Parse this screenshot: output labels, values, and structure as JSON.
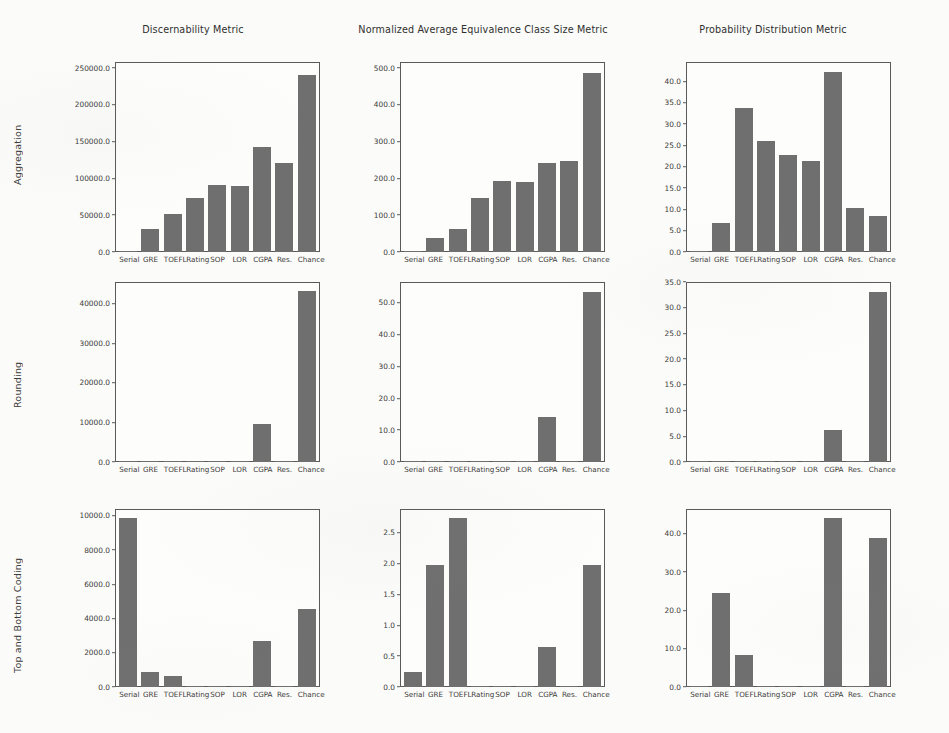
{
  "figure": {
    "row_labels": [
      "Aggregation",
      "Rounding",
      "Top and Bottom Coding"
    ],
    "column_titles": [
      "Discernability Metric",
      "Normalized Average Equivalence Class Size Metric",
      "Probability Distribution Metric"
    ],
    "categories": [
      "Serial",
      "GRE",
      "TOEFL",
      "Rating",
      "SOP",
      "LOR",
      "CGPA",
      "Res.",
      "Chance"
    ],
    "bar_color": "#6f6f6f",
    "background_color": "#fbfbf9",
    "axis_color": "#5a5a5a"
  },
  "chart_data": [
    {
      "type": "bar",
      "title": "Discernability Metric",
      "row": "Aggregation",
      "xlabel": "",
      "ylabel": "",
      "categories": [
        "Serial",
        "GRE",
        "TOEFL",
        "Rating",
        "SOP",
        "LOR",
        "CGPA",
        "Res.",
        "Chance"
      ],
      "values": [
        500.0,
        31000.0,
        52000.0,
        74000.0,
        91000.0,
        89000.0,
        143000.0,
        121000.0,
        241000.0
      ],
      "ylim": [
        0,
        258000
      ],
      "yticks": [
        0.0,
        50000.0,
        100000.0,
        150000.0,
        200000.0,
        250000.0
      ],
      "ytick_labels": [
        "0.0",
        "50000.0",
        "100000.0",
        "150000.0",
        "200000.0",
        "250000.0"
      ],
      "grid": false,
      "legend": "none"
    },
    {
      "type": "bar",
      "title": "Normalized Average Equivalence Class Size Metric",
      "row": "Aggregation",
      "xlabel": "",
      "ylabel": "",
      "categories": [
        "Serial",
        "GRE",
        "TOEFL",
        "Rating",
        "SOP",
        "LOR",
        "CGPA",
        "Res.",
        "Chance"
      ],
      "values": [
        1.0,
        38.0,
        63.0,
        147.0,
        192.0,
        191.0,
        243.0,
        246.0,
        487.0
      ],
      "ylim": [
        0,
        516
      ],
      "yticks": [
        0.0,
        100.0,
        200.0,
        300.0,
        400.0,
        500.0
      ],
      "ytick_labels": [
        "0.0",
        "100.0",
        "200.0",
        "300.0",
        "400.0",
        "500.0"
      ],
      "grid": false,
      "legend": "none"
    },
    {
      "type": "bar",
      "title": "Probability Distribution Metric",
      "row": "Aggregation",
      "xlabel": "",
      "ylabel": "",
      "categories": [
        "Serial",
        "GRE",
        "TOEFL",
        "Rating",
        "SOP",
        "LOR",
        "CGPA",
        "Res.",
        "Chance"
      ],
      "values": [
        0.0,
        6.8,
        33.7,
        26.1,
        22.7,
        21.2,
        42.2,
        10.3,
        8.4
      ],
      "ylim": [
        0,
        44.5
      ],
      "yticks": [
        0.0,
        5.0,
        10.0,
        15.0,
        20.0,
        25.0,
        30.0,
        35.0,
        40.0
      ],
      "ytick_labels": [
        "0.0",
        "5.0",
        "10.0",
        "15.0",
        "20.0",
        "25.0",
        "30.0",
        "35.0",
        "40.0"
      ],
      "grid": false,
      "legend": "none"
    },
    {
      "type": "bar",
      "title": "Discernability Metric",
      "row": "Rounding",
      "xlabel": "",
      "ylabel": "",
      "categories": [
        "Serial",
        "GRE",
        "TOEFL",
        "Rating",
        "SOP",
        "LOR",
        "CGPA",
        "Res.",
        "Chance"
      ],
      "values": [
        0.0,
        0.0,
        0.0,
        0.0,
        0.0,
        0.0,
        9600.0,
        0.0,
        43300.0
      ],
      "ylim": [
        0,
        45500
      ],
      "yticks": [
        0.0,
        10000.0,
        20000.0,
        30000.0,
        40000.0
      ],
      "ytick_labels": [
        "0.0",
        "10000.0",
        "20000.0",
        "30000.0",
        "40000.0"
      ],
      "grid": false,
      "legend": "none"
    },
    {
      "type": "bar",
      "title": "Normalized Average Equivalence Class Size Metric",
      "row": "Rounding",
      "xlabel": "",
      "ylabel": "",
      "categories": [
        "Serial",
        "GRE",
        "TOEFL",
        "Rating",
        "SOP",
        "LOR",
        "CGPA",
        "Res.",
        "Chance"
      ],
      "values": [
        0.0,
        0.0,
        0.0,
        0.0,
        0.0,
        0.0,
        14.0,
        0.0,
        53.5
      ],
      "ylim": [
        0,
        56.5
      ],
      "yticks": [
        0.0,
        10.0,
        20.0,
        30.0,
        40.0,
        50.0
      ],
      "ytick_labels": [
        "0.0",
        "10.0",
        "20.0",
        "30.0",
        "40.0",
        "50.0"
      ],
      "grid": false,
      "legend": "none"
    },
    {
      "type": "bar",
      "title": "Probability Distribution Metric",
      "row": "Rounding",
      "xlabel": "",
      "ylabel": "",
      "categories": [
        "Serial",
        "GRE",
        "TOEFL",
        "Rating",
        "SOP",
        "LOR",
        "CGPA",
        "Res.",
        "Chance"
      ],
      "values": [
        0.0,
        0.0,
        0.0,
        0.0,
        0.0,
        0.0,
        6.3,
        0.0,
        33.0
      ],
      "ylim": [
        0,
        35.0
      ],
      "yticks": [
        0.0,
        5.0,
        10.0,
        15.0,
        20.0,
        25.0,
        30.0,
        35.0
      ],
      "ytick_labels": [
        "0.0",
        "5.0",
        "10.0",
        "15.0",
        "20.0",
        "25.0",
        "30.0",
        "35.0"
      ],
      "grid": false,
      "legend": "none"
    },
    {
      "type": "bar",
      "title": "Discernability Metric",
      "row": "Top and Bottom Coding",
      "xlabel": "",
      "ylabel": "",
      "categories": [
        "Serial",
        "GRE",
        "TOEFL",
        "Rating",
        "SOP",
        "LOR",
        "CGPA",
        "Res.",
        "Chance"
      ],
      "values": [
        9850.0,
        900.0,
        650.0,
        0.0,
        0.0,
        0.0,
        2700.0,
        0.0,
        4580.0
      ],
      "ylim": [
        0,
        10400
      ],
      "yticks": [
        0.0,
        2000.0,
        4000.0,
        6000.0,
        8000.0,
        10000.0
      ],
      "ytick_labels": [
        "0.0",
        "2000.0",
        "4000.0",
        "6000.0",
        "8000.0",
        "10000.0"
      ],
      "grid": false,
      "legend": "none"
    },
    {
      "type": "bar",
      "title": "Normalized Average Equivalence Class Size Metric",
      "row": "Top and Bottom Coding",
      "xlabel": "",
      "ylabel": "",
      "categories": [
        "Serial",
        "GRE",
        "TOEFL",
        "Rating",
        "SOP",
        "LOR",
        "CGPA",
        "Res.",
        "Chance"
      ],
      "values": [
        0.24,
        1.98,
        2.73,
        0.0,
        0.0,
        0.0,
        0.64,
        0.0,
        1.98
      ],
      "ylim": [
        0,
        2.88
      ],
      "yticks": [
        0.0,
        0.5,
        1.0,
        1.5,
        2.0,
        2.5
      ],
      "ytick_labels": [
        "0.0",
        "0.5",
        "1.0",
        "1.5",
        "2.0",
        "2.5"
      ],
      "grid": false,
      "legend": "none"
    },
    {
      "type": "bar",
      "title": "Probability Distribution Metric",
      "row": "Top and Bottom Coding",
      "xlabel": "",
      "ylabel": "",
      "categories": [
        "Serial",
        "GRE",
        "TOEFL",
        "Rating",
        "SOP",
        "LOR",
        "CGPA",
        "Res.",
        "Chance"
      ],
      "values": [
        0.0,
        24.5,
        8.3,
        0.0,
        0.0,
        0.0,
        44.1,
        0.0,
        38.8
      ],
      "ylim": [
        0,
        46.5
      ],
      "yticks": [
        0.0,
        10.0,
        20.0,
        30.0,
        40.0
      ],
      "ytick_labels": [
        "0.0",
        "10.0",
        "20.0",
        "30.0",
        "40.0"
      ],
      "grid": false,
      "legend": "none"
    }
  ]
}
